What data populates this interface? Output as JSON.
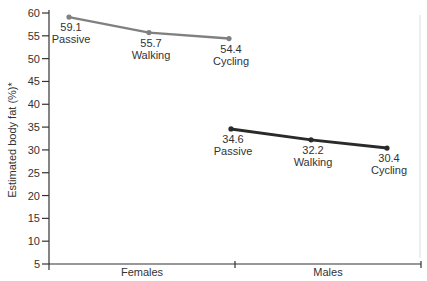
{
  "chart_data": {
    "type": "line",
    "title": "",
    "xlabel": "",
    "ylabel": "Estimated body fat (%)*",
    "ylim": [
      5,
      60
    ],
    "yticks": [
      5,
      10,
      15,
      20,
      25,
      30,
      35,
      40,
      45,
      50,
      55,
      60
    ],
    "grid": false,
    "categories": [
      "Females",
      "Males"
    ],
    "series": [
      {
        "name": "Females",
        "color": "#808080",
        "points": [
          {
            "label": "Passive",
            "value": 59.1
          },
          {
            "label": "Walking",
            "value": 55.7
          },
          {
            "label": "Cycling",
            "value": 54.4
          }
        ]
      },
      {
        "name": "Males",
        "color": "#2a2a2a",
        "points": [
          {
            "label": "Passive",
            "value": 34.6
          },
          {
            "label": "Walking",
            "value": 32.2
          },
          {
            "label": "Cycling",
            "value": 30.4
          }
        ]
      }
    ]
  }
}
